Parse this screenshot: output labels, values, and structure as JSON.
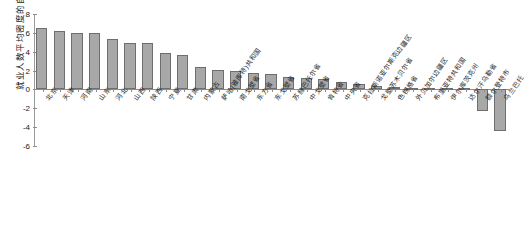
{
  "chart_data": {
    "type": "bar",
    "title": "",
    "xlabel": "",
    "ylabel": "就业人数平均密度的自然对数",
    "ylim": [
      -6,
      8
    ],
    "yticks": [
      8,
      6,
      4,
      2,
      0,
      -2,
      -4,
      -6
    ],
    "grid": false,
    "legend": "none",
    "categories": [
      "北京",
      "天津",
      "河南",
      "山东",
      "河北",
      "山西",
      "陕西",
      "宁夏",
      "甘肃",
      "内蒙古",
      "萨哈(雅库特)共和国",
      "南戈壁省",
      "东方省",
      "东戈壁省",
      "苏赫巴托尔省",
      "中戈壁省",
      "肯特省",
      "中央省",
      "克拉斯诺亚尔斯克边疆区",
      "戈壁苏木贝尔省",
      "色楞格省",
      "外贝加尔边疆区",
      "布里亚特共和国",
      "伊尔库茨克州",
      "达尔汗乌勒省",
      "额尔登特市",
      "乌兰巴托"
    ],
    "values": [
      6.5,
      6.2,
      5.95,
      5.95,
      5.35,
      4.95,
      4.95,
      3.85,
      3.65,
      2.35,
      2.1,
      1.95,
      1.75,
      1.65,
      1.35,
      1.2,
      1.15,
      0.8,
      0.55,
      0.4,
      0.25,
      0.2,
      0.2,
      0.15,
      0.12,
      -2.3,
      -4.4
    ]
  }
}
